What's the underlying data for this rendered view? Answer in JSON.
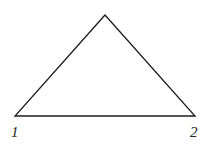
{
  "diagram": {
    "type": "triangle",
    "stroke_color": "#1a1a1a",
    "vertices": {
      "apex": {
        "x": 105,
        "y": 15
      },
      "left": {
        "x": 15,
        "y": 116
      },
      "right": {
        "x": 195,
        "y": 116
      }
    },
    "labels": [
      {
        "id": "vertex-1",
        "text": "1"
      },
      {
        "id": "vertex-2",
        "text": "2"
      }
    ]
  }
}
